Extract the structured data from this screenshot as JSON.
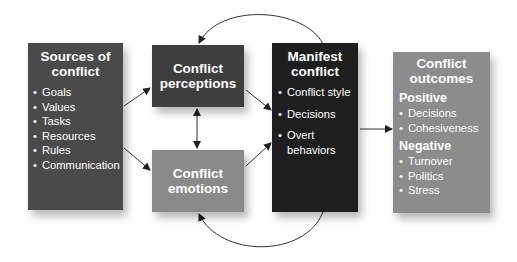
{
  "diagram": {
    "sources": {
      "title_line1": "Sources of",
      "title_line2": "conflict",
      "items": [
        "Goals",
        "Values",
        "Tasks",
        "Resources",
        "Rules",
        "Communication"
      ],
      "color": "#4a4a4a"
    },
    "perceptions": {
      "title_line1": "Conflict",
      "title_line2": "perceptions",
      "color": "#3e3e3e"
    },
    "emotions": {
      "title_line1": "Conflict",
      "title_line2": "emotions",
      "color": "#8a8a8a"
    },
    "manifest": {
      "title_line1": "Manifest",
      "title_line2": "conflict",
      "items": [
        "Conflict style",
        "Decisions",
        "Overt",
        "behaviors"
      ],
      "color": "#1e1e1e"
    },
    "outcomes": {
      "title_line1": "Conflict",
      "title_line2": "outcomes",
      "positive_label": "Positive",
      "positive_items": [
        "Decisions",
        "Cohesiveness"
      ],
      "negative_label": "Negative",
      "negative_items": [
        "Turnover",
        "Politics",
        "Stress"
      ],
      "color": "#8c8c8c"
    },
    "edges": [
      {
        "from": "sources",
        "to": "perceptions"
      },
      {
        "from": "sources",
        "to": "emotions"
      },
      {
        "from": "perceptions",
        "to": "emotions",
        "bidirectional": true
      },
      {
        "from": "perceptions",
        "to": "manifest"
      },
      {
        "from": "emotions",
        "to": "manifest"
      },
      {
        "from": "manifest",
        "to": "outcomes"
      },
      {
        "from": "manifest",
        "to": "perceptions",
        "curved": "top"
      },
      {
        "from": "manifest",
        "to": "emotions",
        "curved": "bottom"
      }
    ]
  }
}
